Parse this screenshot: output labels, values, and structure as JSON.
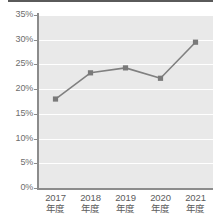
{
  "chart_data": {
    "type": "line",
    "title": "",
    "subtitle": "",
    "xlabel": "",
    "ylabel": "",
    "categories": [
      "2017 年度",
      "2018 年度",
      "2019 年度",
      "2020 年度",
      "2021 年度"
    ],
    "category_years": [
      "2017",
      "2018",
      "2019",
      "2020",
      "2021"
    ],
    "category_suffix": "年度",
    "values": [
      18.0,
      23.3,
      24.3,
      22.2,
      29.5
    ],
    "value_unit": "%",
    "ylim": [
      0,
      35
    ],
    "ytick_values": [
      0,
      5,
      10,
      15,
      20,
      25,
      30,
      35
    ],
    "ytick_labels": [
      "0%",
      "5%",
      "10%",
      "15%",
      "20%",
      "25%",
      "30%",
      "35%"
    ],
    "grid": true,
    "grid_axis": "y",
    "legend": false,
    "legend_position": "none",
    "series": [
      {
        "name": "",
        "values": [
          18.0,
          23.3,
          24.3,
          22.2,
          29.5
        ],
        "line_color": "#808080",
        "marker": "square",
        "marker_color": "#7a7a7a"
      }
    ],
    "colors": {
      "plot_background": "#e9e9e9",
      "page_background": "#ffffff",
      "gridline": "#ffffff",
      "axis": "#8c8c8c",
      "line": "#808080",
      "marker": "#7a7a7a",
      "tick_label": "#6d6d6d",
      "category_label": "#5c5c5c",
      "top_rule": "#5a5a5a"
    }
  }
}
